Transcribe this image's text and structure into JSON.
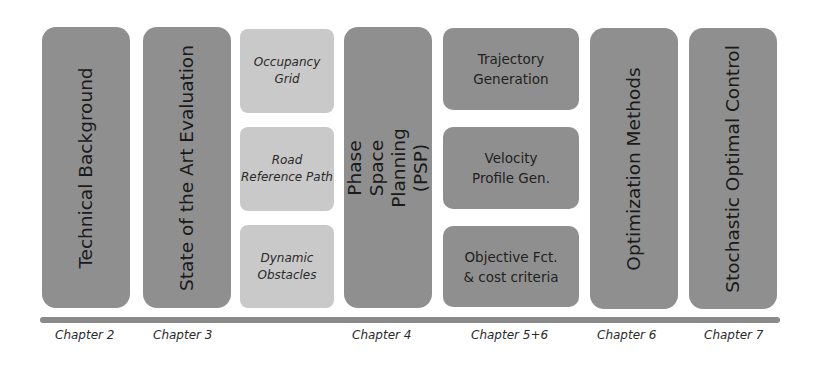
{
  "columns": [
    {
      "title": "Technical Background",
      "chapter": "Chapter 2"
    },
    {
      "title": "State of the Art Evaluation",
      "chapter": "Chapter 3"
    },
    {
      "items": [
        "Occupancy\nGrid",
        "Road\nReference Path",
        "Dynamic\nObstacles"
      ]
    },
    {
      "title": "Phase Space Planning\n(PSP)",
      "chapter": "Chapter 4"
    },
    {
      "items": [
        "Trajectory\nGeneration",
        "Velocity\nProfile Gen.",
        "Objective Fct.\n& cost criteria"
      ],
      "chapter": "Chapter 5+6"
    },
    {
      "title": "Optimization Methods",
      "chapter": "Chapter 6"
    },
    {
      "title": "Stochastic Optimal Control",
      "chapter": "Chapter 7"
    }
  ],
  "colors": {
    "dark_box": "#8f8f8f",
    "light_box": "#c9c9c9",
    "timeline": "#8a8a8a"
  }
}
